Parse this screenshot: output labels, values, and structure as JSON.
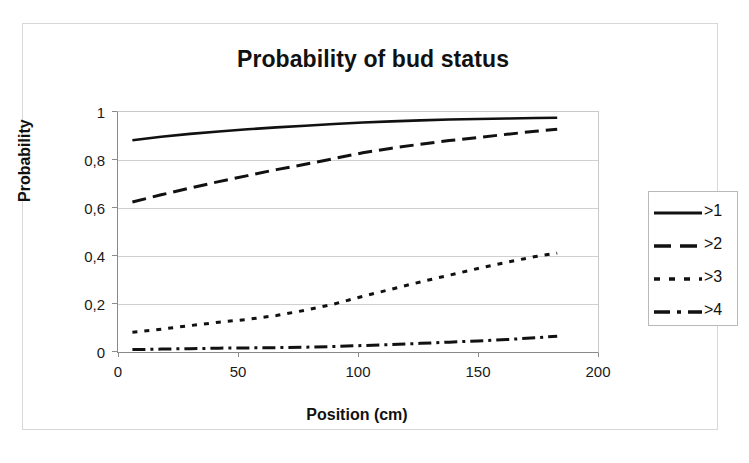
{
  "figure": {
    "title": "Probability of bud status",
    "x_axis_title": "Position (cm)",
    "y_axis_title": "Probability"
  },
  "axes": {
    "x_ticks": [
      "0",
      "50",
      "100",
      "150",
      "200"
    ],
    "y_ticks": [
      "1",
      "0,8",
      "0,6",
      "0,4",
      "0,2",
      "0"
    ]
  },
  "legend": {
    "items": [
      {
        "label": ">1",
        "style": "solid"
      },
      {
        "label": ">2",
        "style": "long-dash"
      },
      {
        "label": ">3",
        "style": "dotted"
      },
      {
        "label": ">4",
        "style": "dash-dot"
      }
    ]
  },
  "chart_data": {
    "type": "line",
    "title": "Probability of bud status",
    "xlabel": "Position (cm)",
    "ylabel": "Probability",
    "xlim": [
      0,
      200
    ],
    "ylim": [
      0,
      1
    ],
    "xticks": [
      0,
      50,
      100,
      150,
      200
    ],
    "yticks": [
      0,
      0.2,
      0.4,
      0.6,
      0.8,
      1
    ],
    "grid": "horizontal",
    "legend_position": "right",
    "x": [
      6,
      18,
      30,
      42,
      54,
      66,
      78,
      90,
      102,
      114,
      126,
      138,
      150,
      162,
      174,
      183
    ],
    "series": [
      {
        "name": ">1",
        "style": "solid",
        "values": [
          0.882,
          0.897,
          0.909,
          0.919,
          0.928,
          0.936,
          0.943,
          0.95,
          0.956,
          0.961,
          0.965,
          0.969,
          0.971,
          0.973,
          0.975,
          0.976
        ]
      },
      {
        "name": ">2",
        "style": "long-dash",
        "values": [
          0.625,
          0.655,
          0.683,
          0.71,
          0.735,
          0.76,
          0.782,
          0.806,
          0.83,
          0.849,
          0.866,
          0.881,
          0.894,
          0.907,
          0.92,
          0.928
        ]
      },
      {
        "name": ">3",
        "style": "dotted",
        "values": [
          0.082,
          0.095,
          0.11,
          0.124,
          0.136,
          0.152,
          0.174,
          0.2,
          0.232,
          0.262,
          0.292,
          0.32,
          0.348,
          0.374,
          0.398,
          0.412
        ]
      },
      {
        "name": ">4",
        "style": "dash-dot",
        "values": [
          0.01,
          0.012,
          0.014,
          0.016,
          0.017,
          0.018,
          0.02,
          0.023,
          0.027,
          0.031,
          0.036,
          0.041,
          0.046,
          0.052,
          0.059,
          0.066
        ]
      }
    ]
  }
}
